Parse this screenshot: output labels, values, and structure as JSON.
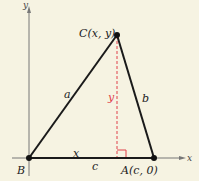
{
  "diagram": {
    "type": "triangle-coordinate-proof",
    "colors": {
      "background": "#f6f3e2",
      "lines": "#1a1a1a",
      "axes": "#777777",
      "altitude": "#e0404a"
    },
    "axes": {
      "x_label": "x",
      "y_label": "y"
    },
    "vertices": {
      "B": {
        "label": "B"
      },
      "A": {
        "label": "A(c, 0)"
      },
      "C": {
        "label": "C(x, y)"
      }
    },
    "sides": {
      "a": "a",
      "b": "b",
      "c": "c"
    },
    "segments": {
      "base_x": "x",
      "altitude_y": "y"
    }
  }
}
